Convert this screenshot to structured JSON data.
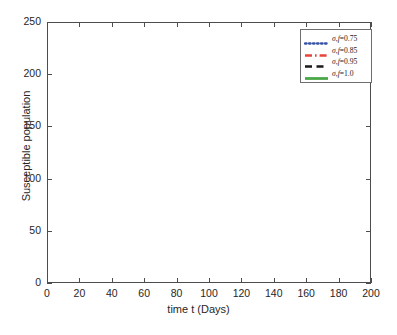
{
  "chart_data": {
    "type": "line",
    "title": "",
    "xlabel": "time t (Days)",
    "ylabel": "Susceptible population",
    "xlim": [
      0,
      200
    ],
    "ylim": [
      0,
      250
    ],
    "xticks": [
      0,
      20,
      40,
      60,
      80,
      100,
      120,
      140,
      160,
      180,
      200
    ],
    "yticks": [
      0,
      50,
      100,
      150,
      200,
      250
    ],
    "grid": false,
    "legend_position": "top-right",
    "x": [
      0,
      10,
      20,
      30,
      40,
      50,
      60,
      70,
      80,
      90,
      100,
      110,
      120,
      130,
      140,
      150,
      160,
      170,
      180,
      190,
      200
    ],
    "series": [
      {
        "name": "σ_f=0.75",
        "color": "#3953a4",
        "style": "dotted",
        "values": [
          220,
          201,
          183,
          165,
          148,
          133,
          119,
          107,
          95,
          85,
          76,
          67,
          60,
          53,
          47,
          41,
          36,
          31,
          26,
          21,
          17
        ]
      },
      {
        "name": "σ_f=0.85",
        "color": "#e8443a",
        "style": "dash-dot",
        "values": [
          220,
          203,
          186,
          170,
          154,
          140,
          126,
          114,
          103,
          93,
          84,
          75,
          68,
          61,
          54,
          48,
          43,
          38,
          32,
          27,
          23
        ]
      },
      {
        "name": "σ_f=0.95",
        "color": "#1a1a1a",
        "style": "dashed",
        "values": [
          220,
          204,
          188,
          173,
          158,
          144,
          131,
          119,
          108,
          98,
          89,
          81,
          73,
          66,
          59,
          53,
          48,
          43,
          38,
          33,
          29
        ]
      },
      {
        "name": "σ_f=1.0",
        "color": "#4aa847",
        "style": "solid",
        "values": [
          220,
          204,
          189,
          174,
          159,
          146,
          133,
          121,
          110,
          100,
          91,
          83,
          75,
          68,
          61,
          55,
          50,
          45,
          40,
          35,
          30
        ]
      }
    ]
  },
  "axes": {
    "xlabel": "time t (Days)",
    "ylabel": "Susceptible population",
    "xtick_labels": [
      "0",
      "20",
      "40",
      "60",
      "80",
      "100",
      "120",
      "140",
      "160",
      "180",
      "200"
    ],
    "ytick_labels": [
      "0",
      "50",
      "100",
      "150",
      "200",
      "250"
    ]
  },
  "legend": {
    "entries": [
      {
        "sigma": "σ",
        "sub": "f",
        "eq": "=0.75"
      },
      {
        "sigma": "σ",
        "sub": "f",
        "eq": "=0.85"
      },
      {
        "sigma": "σ",
        "sub": "f",
        "eq": "=0.95"
      },
      {
        "sigma": "σ",
        "sub": "f",
        "eq": "=1.0"
      }
    ],
    "labels": [
      "σ,f=0.75",
      "σ,f=0.85",
      "σ,f=0.95",
      "σ,f=1.0"
    ]
  }
}
